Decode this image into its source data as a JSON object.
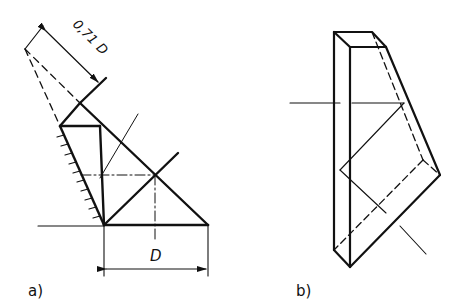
{
  "figure_a": {
    "label": "a)",
    "dimension_diagonal": "0,71 D",
    "dimension_width": "D"
  },
  "figure_b": {
    "label": "b)"
  },
  "colors": {
    "line": "#111111",
    "background": "#ffffff"
  }
}
